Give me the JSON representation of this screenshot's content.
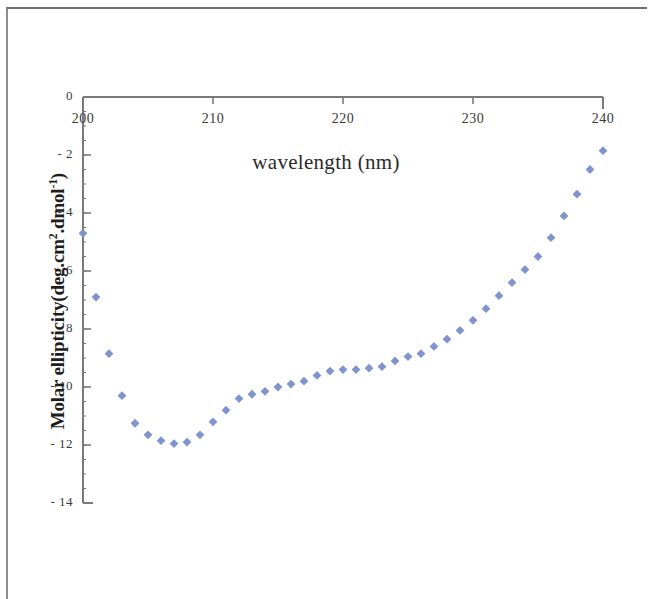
{
  "figure": {
    "background_color": "#ffffff",
    "border_color": "#8d8d8d",
    "marker_color": "#8093cc",
    "axis_color": "#7a7a7a"
  },
  "axes": {
    "x_title": "wavelength (nm)",
    "y_title_main": "Molar ellipticity(deg.cm",
    "y_title_sup1": "2",
    "y_title_mid": ".dmol",
    "y_title_sup2": "-1",
    "y_title_end": ")",
    "x_ticks": [
      "200",
      "210",
      "220",
      "230",
      "240"
    ],
    "y_ticks": [
      "0",
      "- 2",
      "- 4",
      "- 6",
      "- 8",
      "- 10",
      "- 12",
      "- 14"
    ]
  },
  "chart_data": {
    "type": "scatter",
    "title": "",
    "xlabel": "wavelength (nm)",
    "ylabel": "Molar ellipticity(deg.cm2.dmol-1)",
    "xlim": [
      200,
      240
    ],
    "ylim": [
      -14,
      0
    ],
    "xticks": [
      200,
      210,
      220,
      230,
      240
    ],
    "yticks": [
      0,
      -2,
      -4,
      -6,
      -8,
      -10,
      -12,
      -14
    ],
    "grid": false,
    "legend": null,
    "marker": "diamond",
    "marker_color": "#8093cc",
    "series": [
      {
        "name": "CD spectrum",
        "x": [
          200,
          201,
          202,
          203,
          204,
          205,
          206,
          207,
          208,
          209,
          210,
          211,
          212,
          213,
          214,
          215,
          216,
          217,
          218,
          219,
          220,
          221,
          222,
          223,
          224,
          225,
          226,
          227,
          228,
          229,
          230,
          231,
          232,
          233,
          234,
          235,
          236,
          237,
          238,
          239,
          240
        ],
        "y": [
          -4.7,
          -6.9,
          -8.85,
          -10.3,
          -11.25,
          -11.65,
          -11.85,
          -11.95,
          -11.9,
          -11.65,
          -11.2,
          -10.8,
          -10.4,
          -10.25,
          -10.15,
          -10.0,
          -9.9,
          -9.8,
          -9.6,
          -9.45,
          -9.4,
          -9.4,
          -9.35,
          -9.3,
          -9.1,
          -8.95,
          -8.85,
          -8.6,
          -8.35,
          -8.05,
          -7.7,
          -7.3,
          -6.85,
          -6.4,
          -5.95,
          -5.5,
          -4.85,
          -4.1,
          -3.35,
          -2.5,
          -1.85
        ]
      }
    ]
  }
}
